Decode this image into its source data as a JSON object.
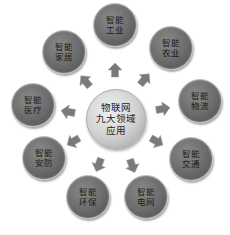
{
  "center": {
    "lines": [
      "物联网",
      "九大领域",
      "应用"
    ]
  },
  "nodes": [
    {
      "id": "industry",
      "lines": [
        "智能",
        "工业"
      ],
      "x": 114,
      "y": 24,
      "r": 21
    },
    {
      "id": "agriculture",
      "lines": [
        "智能",
        "农业"
      ],
      "x": 170,
      "y": 47,
      "r": 21
    },
    {
      "id": "logistics",
      "lines": [
        "智能",
        "物流"
      ],
      "x": 199,
      "y": 100,
      "r": 21
    },
    {
      "id": "transport",
      "lines": [
        "智能",
        "交通"
      ],
      "x": 190,
      "y": 158,
      "r": 21
    },
    {
      "id": "grid",
      "lines": [
        "智能",
        "电网"
      ],
      "x": 145,
      "y": 196,
      "r": 21
    },
    {
      "id": "environment",
      "lines": [
        "智能",
        "环保"
      ],
      "x": 87,
      "y": 196,
      "r": 21
    },
    {
      "id": "security",
      "lines": [
        "智能",
        "安防"
      ],
      "x": 43,
      "y": 157,
      "r": 21
    },
    {
      "id": "medical",
      "lines": [
        "智能",
        "医疗"
      ],
      "x": 32,
      "y": 104,
      "r": 21
    },
    {
      "id": "home",
      "lines": [
        "智能",
        "家居"
      ],
      "x": 63,
      "y": 51,
      "r": 21
    }
  ],
  "arrows": [
    {
      "toward": "industry",
      "x": 115,
      "y": 71,
      "angle": -90
    },
    {
      "toward": "agriculture",
      "x": 144,
      "y": 80,
      "angle": -50
    },
    {
      "toward": "logistics",
      "x": 162,
      "y": 109,
      "angle": -10
    },
    {
      "toward": "transport",
      "x": 156,
      "y": 141,
      "angle": 30
    },
    {
      "toward": "grid",
      "x": 132,
      "y": 165,
      "angle": 70
    },
    {
      "toward": "environment",
      "x": 99,
      "y": 164,
      "angle": 110
    },
    {
      "toward": "security",
      "x": 74,
      "y": 141,
      "angle": 150
    },
    {
      "toward": "medical",
      "x": 69,
      "y": 112,
      "angle": 190
    },
    {
      "toward": "home",
      "x": 86,
      "y": 82,
      "angle": 230
    }
  ],
  "colors": {
    "node_fill": "#6a6a6a",
    "center_fill": "#cfcfcf",
    "arrow_fill": "#7a7a7a"
  }
}
